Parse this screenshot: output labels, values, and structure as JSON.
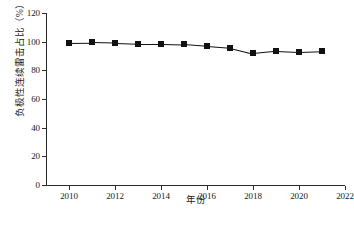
{
  "chart_data": {
    "type": "line",
    "title": "",
    "xlabel": "年份",
    "ylabel": "负极性连续雷击占比（%）",
    "x": [
      2010,
      2011,
      2012,
      2013,
      2014,
      2015,
      2016,
      2017,
      2018,
      2019,
      2020,
      2021
    ],
    "values": [
      99.3,
      99.5,
      99.1,
      98.5,
      98.5,
      98.2,
      97.0,
      95.8,
      91.9,
      93.5,
      92.8,
      93.4
    ],
    "series": [
      {
        "name": "负极性连续雷击占比",
        "values": [
          99.3,
          99.5,
          99.1,
          98.5,
          98.5,
          98.2,
          97.0,
          95.8,
          91.9,
          93.5,
          92.8,
          93.4
        ]
      }
    ],
    "xlim": [
      2009,
      2022
    ],
    "ylim": [
      0,
      120
    ],
    "xticks": [
      2010,
      2012,
      2014,
      2016,
      2018,
      2020,
      2022
    ],
    "xticklabels": [
      "2010",
      "2012",
      "2014",
      "2016",
      "2018",
      "2020",
      "2022"
    ],
    "yticks": [
      0,
      20,
      40,
      60,
      80,
      100,
      120
    ],
    "yticklabels": [
      "0",
      "20",
      "40",
      "60",
      "80",
      "100",
      "120"
    ],
    "grid": false,
    "legend": false,
    "marker": "square",
    "marker_color": "#111111",
    "line_color": "#111111"
  }
}
